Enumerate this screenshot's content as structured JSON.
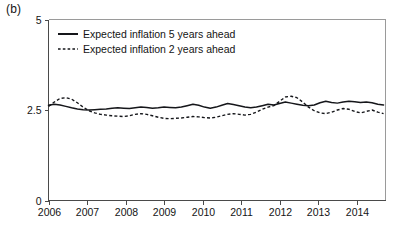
{
  "panel": {
    "label": "(b)"
  },
  "chart_data": {
    "type": "line",
    "title": "",
    "subtitle": "",
    "xlabel": "",
    "ylabel": "",
    "xlim": [
      2006.0,
      2014.75
    ],
    "ylim": [
      0,
      5
    ],
    "grid": false,
    "legend_position": "top-left",
    "x_tick_labels": [
      "2006",
      "2007",
      "2008",
      "2009",
      "2010",
      "2011",
      "2012",
      "2013",
      "2014"
    ],
    "x_ticks": [
      2006,
      2007,
      2008,
      2009,
      2010,
      2011,
      2012,
      2013,
      2014
    ],
    "y_tick_labels": [
      "0",
      "2.5",
      "5"
    ],
    "y_ticks": [
      0,
      2.5,
      5
    ],
    "x": [
      2006.0,
      2006.15,
      2006.3,
      2006.45,
      2006.6,
      2006.75,
      2006.9,
      2007.05,
      2007.2,
      2007.35,
      2007.5,
      2007.65,
      2007.8,
      2007.95,
      2008.1,
      2008.25,
      2008.4,
      2008.55,
      2008.7,
      2008.85,
      2009.0,
      2009.15,
      2009.3,
      2009.45,
      2009.6,
      2009.75,
      2009.9,
      2010.05,
      2010.2,
      2010.35,
      2010.5,
      2010.65,
      2010.8,
      2010.95,
      2011.1,
      2011.25,
      2011.4,
      2011.55,
      2011.7,
      2011.85,
      2012.0,
      2012.15,
      2012.3,
      2012.45,
      2012.6,
      2012.75,
      2012.9,
      2013.05,
      2013.2,
      2013.35,
      2013.5,
      2013.65,
      2013.8,
      2013.95,
      2014.1,
      2014.25,
      2014.4,
      2014.55,
      2014.7
    ],
    "series": [
      {
        "name": "Expected inflation 5 years ahead",
        "style": "solid",
        "color": "#15161a",
        "values": [
          2.63,
          2.66,
          2.64,
          2.6,
          2.56,
          2.53,
          2.51,
          2.5,
          2.51,
          2.52,
          2.53,
          2.55,
          2.56,
          2.55,
          2.54,
          2.56,
          2.58,
          2.57,
          2.55,
          2.56,
          2.58,
          2.57,
          2.56,
          2.58,
          2.62,
          2.66,
          2.63,
          2.58,
          2.55,
          2.58,
          2.63,
          2.68,
          2.65,
          2.62,
          2.58,
          2.56,
          2.58,
          2.62,
          2.66,
          2.64,
          2.68,
          2.72,
          2.69,
          2.66,
          2.63,
          2.62,
          2.64,
          2.7,
          2.74,
          2.71,
          2.69,
          2.72,
          2.74,
          2.73,
          2.71,
          2.72,
          2.7,
          2.66,
          2.64
        ]
      },
      {
        "name": "Expected inflation 2 years ahead",
        "style": "dashed",
        "color": "#15161a",
        "values": [
          2.6,
          2.72,
          2.82,
          2.84,
          2.8,
          2.7,
          2.58,
          2.48,
          2.42,
          2.38,
          2.36,
          2.34,
          2.33,
          2.32,
          2.34,
          2.38,
          2.4,
          2.38,
          2.34,
          2.3,
          2.27,
          2.26,
          2.27,
          2.28,
          2.3,
          2.32,
          2.31,
          2.29,
          2.28,
          2.3,
          2.34,
          2.38,
          2.4,
          2.38,
          2.36,
          2.38,
          2.44,
          2.52,
          2.58,
          2.62,
          2.74,
          2.86,
          2.88,
          2.84,
          2.72,
          2.58,
          2.48,
          2.42,
          2.4,
          2.44,
          2.5,
          2.54,
          2.52,
          2.46,
          2.42,
          2.46,
          2.5,
          2.44,
          2.4
        ]
      }
    ],
    "legend": [
      {
        "label": "Expected inflation 5 years ahead",
        "style": "solid"
      },
      {
        "label": "Expected inflation 2 years ahead",
        "style": "dashed"
      }
    ]
  }
}
